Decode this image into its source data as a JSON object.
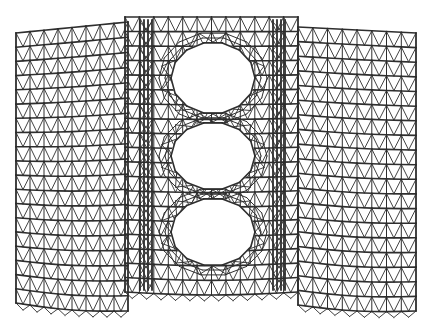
{
  "figure": {
    "title": "",
    "colors": {
      "background": "#ffffff",
      "members": "#2e2e2e",
      "nodes": "#1e1e1e"
    }
  },
  "structure": {
    "panels": [
      {
        "name": "left-wing",
        "x0": 16,
        "x1": 128,
        "top0": 33,
        "top1": 22,
        "bot0": 303,
        "bot1": 311,
        "cols": 8,
        "rows": 19
      },
      {
        "name": "center",
        "x0": 125,
        "x1": 298,
        "top0": 17,
        "top1": 17,
        "bot0": 292,
        "bot1": 292,
        "cols": 12,
        "rows": 19
      },
      {
        "name": "right-wing",
        "x0": 298,
        "x1": 416,
        "top0": 27,
        "top1": 33,
        "bot0": 305,
        "bot1": 311,
        "cols": 8,
        "rows": 19
      }
    ],
    "openings": [
      {
        "name": "opening-top",
        "cx": 213,
        "cy": 78,
        "rx": 42,
        "ry": 36
      },
      {
        "name": "opening-middle",
        "cx": 213,
        "cy": 156,
        "rx": 42,
        "ry": 34
      },
      {
        "name": "opening-bottom",
        "cx": 213,
        "cy": 232,
        "rx": 42,
        "ry": 34
      }
    ],
    "inner_frame": {
      "x0": 140,
      "x1": 285
    }
  }
}
